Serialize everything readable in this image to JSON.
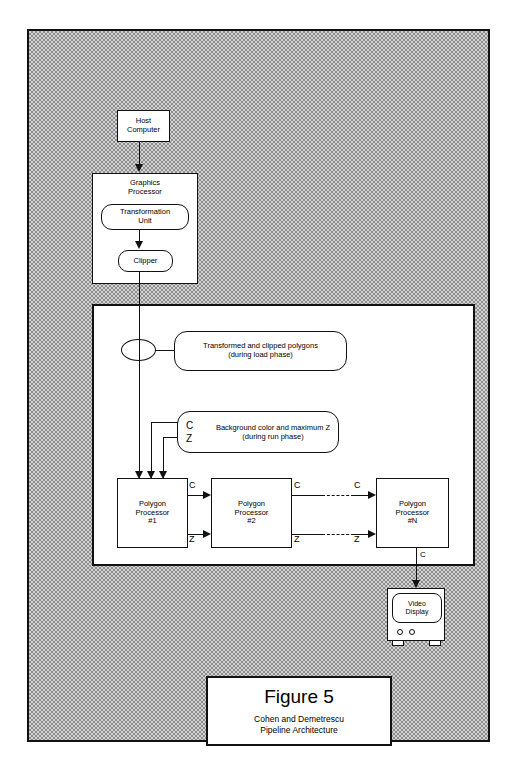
{
  "figure": {
    "number": "Figure 5",
    "subtitle_line1": "Cohen and Demetrescu",
    "subtitle_line2": "Pipeline Architecture"
  },
  "nodes": {
    "host_computer": "Host\nComputer",
    "host_computer_line1": "Host",
    "host_computer_line2": "Computer",
    "graphics_processor_line1": "Graphics",
    "graphics_processor_line2": "Processor",
    "transformation_unit_line1": "Transformation",
    "transformation_unit_line2": "Unit",
    "clipper": "Clipper",
    "video_display_line1": "Video",
    "video_display_line2": "Display"
  },
  "notes": {
    "transformed_line1": "Transformed and clipped polygons",
    "transformed_line2": "(during load phase)",
    "background_line1": "Background color and maximum Z",
    "background_line2": "(during run phase)",
    "background_c": "C",
    "background_z": "Z"
  },
  "processors": [
    {
      "line1": "Polygon",
      "line2": "Processor",
      "line3": "#1"
    },
    {
      "line1": "Polygon",
      "line2": "Processor",
      "line3": "#2"
    },
    {
      "line1": "Polygon",
      "line2": "Processor",
      "line3": "#N"
    }
  ],
  "signals": {
    "pp1_out_c": "C",
    "pp1_out_z": "Z",
    "pp2_out_c": "C",
    "pp2_out_z": "Z",
    "ppn_in_c": "C",
    "ppn_in_z": "Z",
    "ppn_out_c": "C"
  },
  "colors": {
    "ink": "#111111",
    "paper": "#ffffff",
    "hatch_dark": "#8e8e8e",
    "hatch_light": "#d2d2d2"
  }
}
